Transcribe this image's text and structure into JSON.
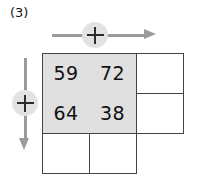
{
  "problem": {
    "label": "(3)"
  },
  "operators": {
    "row_symbol": "+",
    "column_symbol": "+",
    "row_arrow_direction": "right",
    "column_arrow_direction": "down",
    "row_arrow_icon": "arrow-right-icon",
    "column_arrow_icon": "arrow-down-icon"
  },
  "colors": {
    "shaded_cell": "#e0e0e0",
    "grid_line": "#454545",
    "arrow": "#9a9a9a",
    "badge": "#e2e2e2",
    "text": "#111111",
    "background": "#ffffff"
  },
  "grid": {
    "rows": 3,
    "columns": 3,
    "cells": [
      [
        {
          "value": "59",
          "shaded": true,
          "open": false
        },
        {
          "value": "72",
          "shaded": true,
          "open": false
        },
        {
          "value": "",
          "shaded": false,
          "open": false
        }
      ],
      [
        {
          "value": "64",
          "shaded": true,
          "open": false
        },
        {
          "value": "38",
          "shaded": true,
          "open": false
        },
        {
          "value": "",
          "shaded": false,
          "open": false
        }
      ],
      [
        {
          "value": "",
          "shaded": false,
          "open": false
        },
        {
          "value": "",
          "shaded": false,
          "open": false
        },
        {
          "value": "",
          "shaded": false,
          "open": true
        }
      ]
    ]
  },
  "chart_data": {
    "type": "table",
    "title": "(3)",
    "rows": 3,
    "columns": 3,
    "values": [
      [
        "59",
        "72",
        ""
      ],
      [
        "64",
        "38",
        ""
      ],
      [
        "",
        "",
        ""
      ]
    ],
    "filled_block": {
      "rows": 2,
      "columns": 2,
      "values": [
        [
          59,
          72
        ],
        [
          64,
          38
        ]
      ]
    },
    "row_operation": "+",
    "column_operation": "+",
    "annotations": [
      "(3)",
      "+",
      "+"
    ]
  }
}
